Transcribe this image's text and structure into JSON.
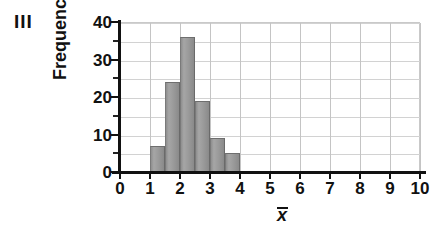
{
  "panel": {
    "label": "III"
  },
  "chart_data": {
    "type": "bar",
    "title": "",
    "subtitle": "",
    "xlabel": "x̄",
    "ylabel": "Frequency",
    "xlim": [
      0,
      10
    ],
    "ylim": [
      0,
      40
    ],
    "grid": true,
    "legend": null,
    "xticks": [
      "0",
      "1",
      "2",
      "3",
      "4",
      "5",
      "6",
      "7",
      "8",
      "9",
      "10"
    ],
    "xtick_values": [
      0,
      1,
      2,
      3,
      4,
      5,
      6,
      7,
      8,
      9,
      10
    ],
    "yticks": [
      "0",
      "10",
      "20",
      "30",
      "40"
    ],
    "ytick_values": [
      0,
      10,
      20,
      30,
      40
    ],
    "y_minor_ticks": [
      5,
      15,
      25,
      35
    ],
    "gridlines_y": [
      5,
      10,
      15,
      20,
      25,
      30,
      35,
      40
    ],
    "gridlines_x": [
      1,
      2,
      3,
      4,
      5,
      6,
      7,
      8,
      9,
      10
    ],
    "bin_width": 0.5,
    "bin_edges": [
      1.0,
      1.5,
      2.0,
      2.5,
      3.0,
      3.5,
      4.0
    ],
    "categories": [
      "1.0-1.5",
      "1.5-2.0",
      "2.0-2.5",
      "2.5-3.0",
      "3.0-3.5",
      "3.5-4.0"
    ],
    "values": [
      7,
      24,
      36,
      19,
      9,
      5
    ],
    "bar_color": "#9b9b9b",
    "bar_edge_color": "#6e6e6e",
    "axis_color": "#111111",
    "grid_color": "#d2d2d2"
  }
}
